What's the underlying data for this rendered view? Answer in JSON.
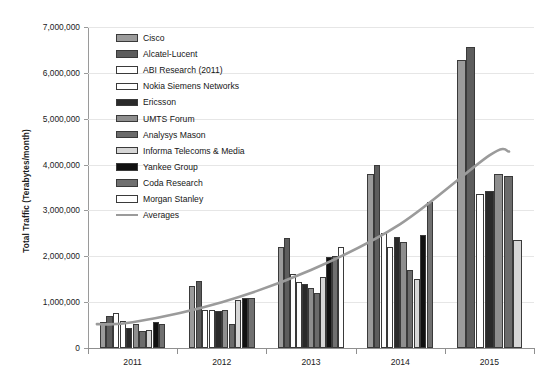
{
  "chart_data": {
    "type": "bar",
    "title": "",
    "subtitle": "",
    "xlabel": "",
    "ylabel": "Total Traffic (Terabytes/month)",
    "categories": [
      "2011",
      "2012",
      "2013",
      "2014",
      "2015"
    ],
    "ylim": [
      0,
      7000000
    ],
    "ytick_labels": [
      "0",
      "1,000,000",
      "2,000,000",
      "3,000,000",
      "4,000,000",
      "5,000,000",
      "6,000,000",
      "7,000,000"
    ],
    "ytick_values": [
      0,
      1000000,
      2000000,
      3000000,
      4000000,
      5000000,
      6000000,
      7000000
    ],
    "grid": true,
    "legend_position": "upper-left-inside",
    "series": [
      {
        "name": "Cisco",
        "swatch": "#9b9b9b",
        "values": [
          560000,
          1350000,
          2200000,
          3800000,
          6280000
        ]
      },
      {
        "name": "Alcatel-Lucent",
        "swatch": "#5d5d5d",
        "values": [
          700000,
          1460000,
          2400000,
          4000000,
          6570000
        ]
      },
      {
        "name": "ABI Research (2011)",
        "swatch": "#ffffff",
        "values": [
          760000,
          820000,
          1620000,
          2500000,
          null
        ]
      },
      {
        "name": "Nokia Siemens Networks",
        "swatch": "#ffffff",
        "values": [
          590000,
          830000,
          1450000,
          2200000,
          3350000
        ]
      },
      {
        "name": "Ericsson",
        "swatch": "#2a2a2a",
        "values": [
          430000,
          800000,
          1390000,
          2430000,
          3420000
        ]
      },
      {
        "name": "UMTS Forum",
        "swatch": "#8e8e8e",
        "values": [
          530000,
          830000,
          1310000,
          2320000,
          3800000
        ]
      },
      {
        "name": "Analysys Mason",
        "swatch": "#6b6b6b",
        "values": [
          380000,
          520000,
          1200000,
          1700000,
          3760000
        ]
      },
      {
        "name": "Informa Telecoms & Media",
        "swatch": "#d6d6d6",
        "values": [
          390000,
          1040000,
          1540000,
          1500000,
          2350000
        ]
      },
      {
        "name": "Yankee Group",
        "swatch": "#111111",
        "values": [
          570000,
          1080000,
          1980000,
          2470000,
          null
        ]
      },
      {
        "name": "Coda Research",
        "swatch": "#707070",
        "values": [
          520000,
          1080000,
          2000000,
          3180000,
          null
        ]
      },
      {
        "name": "Morgan Stanley",
        "swatch": "#ffffff",
        "values": [
          null,
          null,
          2200000,
          null,
          null
        ]
      }
    ],
    "trend": {
      "name": "Averages",
      "color": "#9b9b9b",
      "x": [
        "2011",
        "2012",
        "2013",
        "2014",
        "2015"
      ],
      "values": [
        560000,
        1000000,
        1700000,
        2700000,
        4200000
      ]
    }
  },
  "legend": {
    "entries": [
      {
        "label": "Cisco"
      },
      {
        "label": "Alcatel-Lucent"
      },
      {
        "label": "ABI Research (2011)"
      },
      {
        "label": "Nokia Siemens Networks"
      },
      {
        "label": "Ericsson"
      },
      {
        "label": "UMTS Forum"
      },
      {
        "label": "Analysys Mason"
      },
      {
        "label": "Informa Telecoms & Media"
      },
      {
        "label": "Yankee Group"
      },
      {
        "label": "Coda Research"
      },
      {
        "label": "Morgan Stanley"
      },
      {
        "label": "Averages"
      }
    ]
  }
}
